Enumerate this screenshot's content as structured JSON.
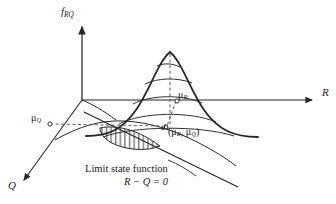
{
  "figure": {
    "background_color": "#ffffff",
    "stroke_color": "#262626",
    "axes": {
      "vertical": {
        "name": "f_RQ",
        "label_main": "f",
        "label_sub": "RQ",
        "direction": "up"
      },
      "horizontal_right": {
        "name": "R",
        "label": "R",
        "direction": "right"
      },
      "depth_left": {
        "name": "Q",
        "label": "Q",
        "direction": "down-left"
      }
    },
    "markers": {
      "mu_R": {
        "label_main": "μ",
        "label_sub": "R",
        "text": "μR"
      },
      "mu_Q": {
        "label_main": "μ",
        "label_sub": "Q",
        "text": "μQ"
      },
      "distance": {
        "label": "d",
        "description": "shortest distance from mean point to limit state line"
      },
      "mean_point": {
        "open_paren": "(",
        "mu_r": "μ",
        "mu_r_sub": "R",
        "comma": ", ",
        "mu_q": "μ",
        "mu_q_sub": "Q",
        "close_paren": ")",
        "text": "(μR, μQ)"
      }
    },
    "annotations": {
      "limit_state_caption": "Limit state function",
      "limit_state_equation": "R − Q = 0"
    },
    "shaded_region": {
      "name": "failure-region",
      "hatch": "vertical-lines",
      "hatch_count": 9
    },
    "contours": {
      "count": 5,
      "type": "elliptical-level-curves"
    }
  }
}
